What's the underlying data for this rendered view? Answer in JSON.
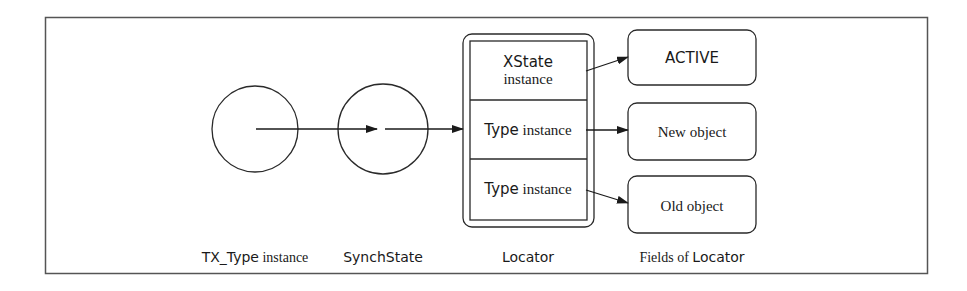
{
  "diagram": {
    "stroke_color": "#2a2a2a",
    "frame_color": "#555555",
    "nodes": {
      "tx_type": {
        "kind": "circle"
      },
      "synch_state": {
        "kind": "circle"
      },
      "locator": {
        "kind": "compound-box",
        "cells": [
          {
            "line1": "XState",
            "line2": "instance"
          },
          {
            "label_sans": "Type",
            "label_serif": "instance"
          },
          {
            "label_sans": "Type",
            "label_serif": "instance"
          }
        ]
      },
      "fields": [
        {
          "label": "ACTIVE",
          "style": "sans"
        },
        {
          "label": "New object",
          "style": "serif"
        },
        {
          "label": "Old object",
          "style": "serif"
        }
      ]
    },
    "captions": {
      "tx_type": {
        "sans": "TX_Type",
        "serif": "instance"
      },
      "synch_state": {
        "sans": "SynchState"
      },
      "locator": {
        "sans": "Locator"
      },
      "fields": {
        "serif": "Fields of",
        "sans": "Locator"
      }
    },
    "edges": [
      {
        "from": "tx_type",
        "to": "synch_state"
      },
      {
        "from": "synch_state",
        "to": "locator"
      },
      {
        "from": "locator.cell0",
        "to": "fields.0"
      },
      {
        "from": "locator.cell1",
        "to": "fields.1"
      },
      {
        "from": "locator.cell2",
        "to": "fields.2"
      }
    ]
  }
}
